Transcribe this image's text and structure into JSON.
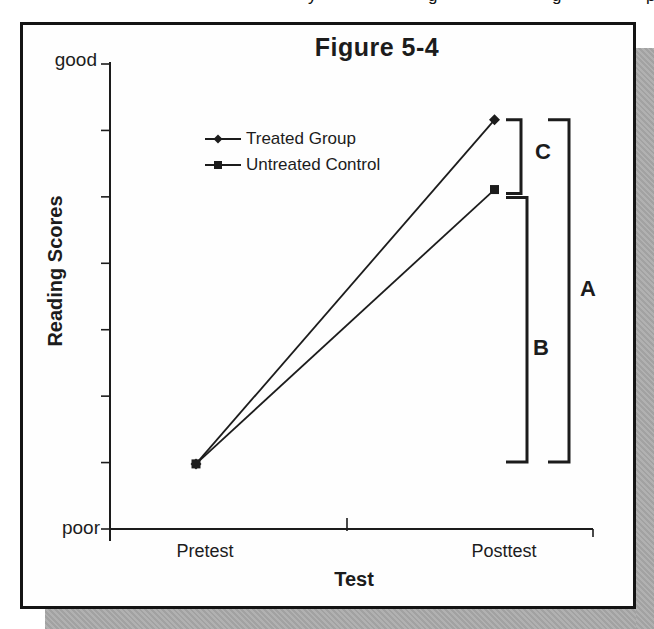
{
  "page": {
    "background": "#ffffff",
    "shadow_color": "#a9a9a9",
    "cropped_text_fragments": [
      "y",
      "g",
      "g",
      "p"
    ]
  },
  "chart_data": {
    "type": "line",
    "title": "Figure 5-4",
    "xlabel": "Test",
    "ylabel": "Reading Scores",
    "categories": [
      "Pretest",
      "Posttest"
    ],
    "y_axis": {
      "top_label": "good",
      "bottom_label": "poor",
      "min": 0,
      "max": 1,
      "tick_count": 8,
      "numeric_labels_shown": false
    },
    "series": [
      {
        "name": "Treated Group",
        "marker": "diamond",
        "values": [
          0.14,
          0.88
        ]
      },
      {
        "name": "Untreated Control",
        "marker": "square",
        "values": [
          0.14,
          0.73
        ]
      }
    ],
    "annotations": [
      {
        "label": "A",
        "type": "bracket",
        "at": "Posttest",
        "span_values": [
          0.14,
          0.88
        ]
      },
      {
        "label": "B",
        "type": "bracket",
        "at": "Posttest",
        "span_values": [
          0.14,
          0.73
        ]
      },
      {
        "label": "C",
        "type": "bracket",
        "at": "Posttest",
        "span_values": [
          0.73,
          0.88
        ]
      }
    ],
    "ink_color": "#1c1c1c",
    "legend_position": "upper-left-inside",
    "grid": false
  }
}
